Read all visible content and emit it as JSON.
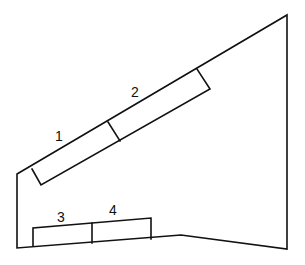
{
  "diagram": {
    "labels": {
      "panel_1": "1",
      "panel_2": "2",
      "panel_3": "3",
      "panel_4": "4"
    },
    "colors": {
      "line": "#111111",
      "background": "#ffffff"
    }
  }
}
